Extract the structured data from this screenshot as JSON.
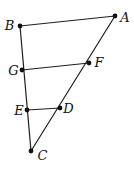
{
  "figure": {
    "background": "#ffffff",
    "line_color": "#1f1f1f",
    "line_width": 1.2,
    "dot_color": "#111111",
    "dot_radius": 2.4,
    "label_color": "#111111",
    "label_font_size": 13,
    "points": [
      {
        "id": "B",
        "label": "B",
        "x": 20,
        "y": 26,
        "label_x": 9.5,
        "label_y": 30
      },
      {
        "id": "A",
        "label": "A",
        "x": 115,
        "y": 16,
        "label_x": 125,
        "label_y": 21.5
      },
      {
        "id": "G",
        "label": "G",
        "x": 22,
        "y": 70,
        "label_x": 13.5,
        "label_y": 74.5
      },
      {
        "id": "F",
        "label": "F",
        "x": 89,
        "y": 63,
        "label_x": 99,
        "label_y": 67
      },
      {
        "id": "E",
        "label": "E",
        "x": 27,
        "y": 110,
        "label_x": 19,
        "label_y": 114.5
      },
      {
        "id": "D",
        "label": "D",
        "x": 60,
        "y": 108,
        "label_x": 68.5,
        "label_y": 112.5
      },
      {
        "id": "C",
        "label": "C",
        "x": 31,
        "y": 151,
        "label_x": 42.5,
        "label_y": 159.5
      }
    ],
    "segments": [
      {
        "from": "B",
        "to": "A"
      },
      {
        "from": "B",
        "to": "C"
      },
      {
        "from": "A",
        "to": "C"
      },
      {
        "from": "G",
        "to": "F"
      },
      {
        "from": "E",
        "to": "D"
      }
    ]
  }
}
